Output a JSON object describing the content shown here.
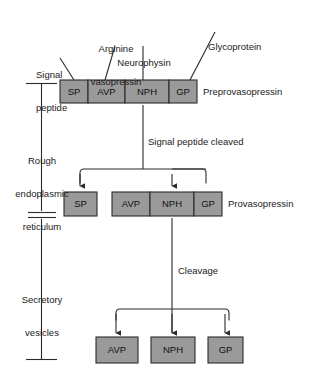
{
  "diagram": {
    "colors": {
      "segment_fill": "#9a9a9a",
      "segment_stroke": "#2b2b2b",
      "line": "#2b2b2b",
      "text": "#1a1a1a"
    },
    "callout_labels": [
      {
        "id": "signal-peptide",
        "text": "Signal\npeptide",
        "line1": "Signal",
        "line2": "peptide"
      },
      {
        "id": "arginine-vasopressin",
        "text": "Arginine\nvasopressin",
        "line1": "Arginine",
        "line2": "vasopressin"
      },
      {
        "id": "neurophysin",
        "text": "Neurophysin",
        "line1": "Neurophysin",
        "line2": ""
      },
      {
        "id": "glycoprotein",
        "text": "Glycoprotein",
        "line1": "Glycoprotein",
        "line2": ""
      }
    ],
    "bracket_labels": [
      {
        "id": "rough-er",
        "line1": "Rough",
        "line2": "endoplasmic",
        "line3": "reticulum"
      },
      {
        "id": "secretory-vesicles",
        "line1": "Secretory",
        "line2": "vesicles",
        "line3": ""
      }
    ],
    "process_labels": [
      {
        "id": "signal-peptide-cleaved",
        "text": "Signal peptide cleaved"
      },
      {
        "id": "cleavage",
        "text": "Cleavage"
      }
    ],
    "rows": [
      {
        "id": "preprovasopressin",
        "name": "Preprovasopressin",
        "segments": [
          {
            "id": "sp",
            "label": "SP"
          },
          {
            "id": "avp",
            "label": "AVP"
          },
          {
            "id": "nph",
            "label": "NPH"
          },
          {
            "id": "gp",
            "label": "GP"
          }
        ]
      },
      {
        "id": "provasopressin",
        "name": "Provasopressin",
        "segments": [
          {
            "id": "sp",
            "label": "SP"
          },
          {
            "id": "avp",
            "label": "AVP"
          },
          {
            "id": "nph",
            "label": "NPH"
          },
          {
            "id": "gp",
            "label": "GP"
          }
        ]
      },
      {
        "id": "products",
        "name": "",
        "segments": [
          {
            "id": "avp",
            "label": "AVP"
          },
          {
            "id": "nph",
            "label": "NPH"
          },
          {
            "id": "gp",
            "label": "GP"
          }
        ]
      }
    ]
  }
}
